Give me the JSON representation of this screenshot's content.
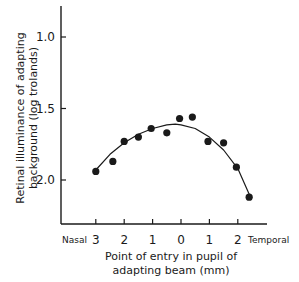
{
  "chart_data": {
    "type": "scatter",
    "title": "",
    "xlabel": [
      "Point of entry in pupil of",
      "adapting beam (mm)"
    ],
    "ylabel": [
      "Retinal illuminance of adapting",
      "background (log trolands)"
    ],
    "x_side_labels": {
      "left": "Nasal",
      "right": "Temporal"
    },
    "x_ticks": [
      {
        "value": 3,
        "label": "3"
      },
      {
        "value": 2,
        "label": "2"
      },
      {
        "value": 1,
        "label": "1"
      },
      {
        "value": 0,
        "label": "0"
      },
      {
        "value": -1,
        "label": "1"
      },
      {
        "value": -2,
        "label": "2"
      }
    ],
    "y_ticks": [
      {
        "value": 1.0,
        "label": "1.0"
      },
      {
        "value": 1.5,
        "label": "1.5"
      },
      {
        "value": 2.0,
        "label": "2.0"
      }
    ],
    "y_inverted": true,
    "ylim": [
      0.8,
      2.3
    ],
    "xlim": [
      3.4,
      -3.0
    ],
    "x_note": "positive = nasal, negative = temporal",
    "grid": false,
    "legend": null,
    "series": [
      {
        "name": "measurements",
        "marker": "filled-circle",
        "points": [
          {
            "x": 3.0,
            "y": 1.94
          },
          {
            "x": 2.4,
            "y": 1.87
          },
          {
            "x": 2.0,
            "y": 1.73
          },
          {
            "x": 1.5,
            "y": 1.7
          },
          {
            "x": 1.05,
            "y": 1.64
          },
          {
            "x": 0.5,
            "y": 1.67
          },
          {
            "x": 0.05,
            "y": 1.57
          },
          {
            "x": -0.4,
            "y": 1.56
          },
          {
            "x": -0.95,
            "y": 1.73
          },
          {
            "x": -1.5,
            "y": 1.74
          },
          {
            "x": -1.95,
            "y": 1.91
          },
          {
            "x": -2.4,
            "y": 2.12
          }
        ]
      },
      {
        "name": "fitted-curve",
        "type": "line",
        "points": [
          {
            "x": 3.0,
            "y": 1.93
          },
          {
            "x": 2.5,
            "y": 1.82
          },
          {
            "x": 2.0,
            "y": 1.74
          },
          {
            "x": 1.5,
            "y": 1.68
          },
          {
            "x": 1.0,
            "y": 1.64
          },
          {
            "x": 0.5,
            "y": 1.615
          },
          {
            "x": 0.2,
            "y": 1.61
          },
          {
            "x": 0.0,
            "y": 1.615
          },
          {
            "x": -0.5,
            "y": 1.64
          },
          {
            "x": -1.0,
            "y": 1.7
          },
          {
            "x": -1.5,
            "y": 1.79
          },
          {
            "x": -2.0,
            "y": 1.92
          },
          {
            "x": -2.4,
            "y": 2.1
          }
        ]
      }
    ]
  },
  "colors": {
    "ink": "#1a1a1a",
    "background": "#ffffff"
  }
}
